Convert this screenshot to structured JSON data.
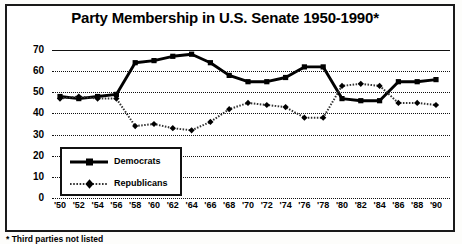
{
  "chart_data": {
    "type": "line",
    "title": "Party Membership in U.S. Senate  1950-1990*",
    "xlabel": "",
    "ylabel": "",
    "ylim": [
      0,
      70
    ],
    "yticks": [
      0,
      10,
      20,
      30,
      40,
      50,
      60,
      70
    ],
    "grid": true,
    "legend_position": "inside-lower-left",
    "footnote": "* Third parties not listed",
    "categories": [
      "'50",
      "'52",
      "'54",
      "'56",
      "'58",
      "'60",
      "'62",
      "'64",
      "'66",
      "'68",
      "'70",
      "'72",
      "'74",
      "'76",
      "'78",
      "'80",
      "'82",
      "'84",
      "'86",
      "'88",
      "'90"
    ],
    "series": [
      {
        "name": "Democrats",
        "color": "#000000",
        "style": "solid-thick",
        "marker": "square",
        "values": [
          48,
          47,
          48,
          49,
          64,
          65,
          67,
          68,
          64,
          58,
          55,
          55,
          57,
          62,
          62,
          47,
          46,
          46,
          55,
          55,
          56
        ]
      },
      {
        "name": "Republicans",
        "color": "#333333",
        "style": "dotted-thin",
        "marker": "diamond",
        "values": [
          47,
          48,
          47,
          47,
          34,
          35,
          33,
          32,
          36,
          42,
          45,
          44,
          43,
          38,
          38,
          53,
          54,
          53,
          45,
          45,
          44
        ]
      }
    ]
  },
  "legend": {
    "items": [
      {
        "label": "Democrats"
      },
      {
        "label": "Republicans"
      }
    ]
  }
}
